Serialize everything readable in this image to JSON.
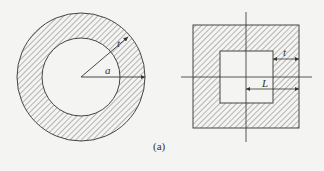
{
  "figure": {
    "caption": "(a)",
    "left_shape": {
      "type": "hollow-circle",
      "labels": {
        "thickness": "t",
        "radius": "a"
      }
    },
    "right_shape": {
      "type": "hollow-square",
      "labels": {
        "thickness": "t",
        "half_length": "L"
      }
    },
    "colors": {
      "stroke": "#444444",
      "hatch": "#666666",
      "background": "#f4f4f2"
    }
  }
}
